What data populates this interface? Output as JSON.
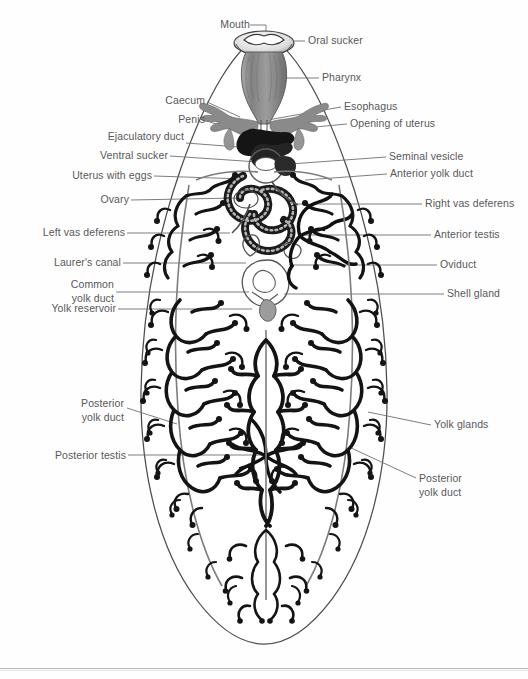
{
  "figure": {
    "organism_outline_color": "#4a4a4a",
    "leader_line_color": "#6d6d6f",
    "label_text_color": "#58585a",
    "yolk_gland_color": "#1a1a1a",
    "pharynx_fill": "#8e8e8e",
    "caecum_fill": "#8c8c8c",
    "background": "#ffffff"
  },
  "labels_left": [
    {
      "id": "mouth",
      "text": "Mouth",
      "x": 204,
      "y": 24,
      "w": 44,
      "lines": [
        "Mouth"
      ]
    },
    {
      "id": "caecum",
      "text": "Caecum",
      "x": 152,
      "y": 100,
      "w": 52,
      "lines": [
        "Caecum"
      ]
    },
    {
      "id": "penis",
      "text": "Penis",
      "x": 164,
      "y": 119,
      "w": 40,
      "lines": [
        "Penis"
      ]
    },
    {
      "id": "ejaculatory-duct",
      "text": "Ejaculatory duct",
      "x": 86,
      "y": 135,
      "w": 96,
      "lines": [
        "Ejaculatory",
        " duct"
      ]
    },
    {
      "id": "ventral-sucker",
      "text": "Ventral sucker",
      "x": 79,
      "y": 153,
      "w": 88,
      "lines": [
        "Ventral sucker"
      ]
    },
    {
      "id": "uterus-with-eggs",
      "text": "Uterus with eggs",
      "x": 53,
      "y": 173,
      "w": 98,
      "lines": [
        "Uterus with eggs"
      ]
    },
    {
      "id": "ovary",
      "text": "Ovary",
      "x": 88,
      "y": 197,
      "w": 40,
      "lines": [
        "Ovary"
      ]
    },
    {
      "id": "left-vas-deferens",
      "text": "Left vas deferens",
      "x": 24,
      "y": 230,
      "w": 100,
      "lines": [
        "Left vas deferens"
      ]
    },
    {
      "id": "laurers-canal",
      "text": "Laurer's canal",
      "x": 34,
      "y": 260,
      "w": 86,
      "lines": [
        "Laurer's canal"
      ]
    },
    {
      "id": "common-yolk-duct",
      "text": "Common yolk duct",
      "x": 27,
      "y": 281,
      "w": 86,
      "lines": [
        "Common",
        "yolk duct"
      ]
    },
    {
      "id": "yolk-reservoir",
      "text": "Yolk reservoir",
      "x": 31,
      "y": 306,
      "w": 84,
      "lines": [
        "Yolk reservoir"
      ]
    },
    {
      "id": "posterior-yolk-duct-left",
      "text": "Posterior yolk duct",
      "x": 57,
      "y": 401,
      "w": 66,
      "lines": [
        "Posterior",
        "yolk duct"
      ]
    },
    {
      "id": "posterior-testis",
      "text": "Posterior testis",
      "x": 35,
      "y": 453,
      "w": 90,
      "lines": [
        "Posterior testis"
      ]
    }
  ],
  "labels_right": [
    {
      "id": "oral-sucker",
      "text": "Oral sucker",
      "x": 308,
      "y": 39,
      "lines": [
        "Oral sucker"
      ]
    },
    {
      "id": "pharynx",
      "text": "Pharynx",
      "x": 322,
      "y": 76,
      "lines": [
        "Pharynx"
      ]
    },
    {
      "id": "esophagus",
      "text": "Esophagus",
      "x": 344,
      "y": 105,
      "lines": [
        "Esophagus"
      ]
    },
    {
      "id": "opening-of-uterus",
      "text": "Opening of uterus",
      "x": 350,
      "y": 122,
      "lines": [
        "Opening of uterus"
      ]
    },
    {
      "id": "seminal-vesicle",
      "text": "Seminal vesicle",
      "x": 389,
      "y": 155,
      "lines": [
        "Seminal vesicle"
      ]
    },
    {
      "id": "anterior-yolk-duct",
      "text": "Anterior yolk duct",
      "x": 390,
      "y": 172,
      "lines": [
        "Anterior yolk duct"
      ]
    },
    {
      "id": "right-vas-deferens",
      "text": "Right vas deferens",
      "x": 425,
      "y": 202,
      "lines": [
        "Right vas deferens"
      ]
    },
    {
      "id": "anterior-testis",
      "text": "Anterior testis",
      "x": 434,
      "y": 233,
      "lines": [
        "Anterior testis"
      ]
    },
    {
      "id": "oviduct",
      "text": "Oviduct",
      "x": 440,
      "y": 263,
      "lines": [
        "Oviduct"
      ]
    },
    {
      "id": "shell-gland",
      "text": "Shell gland",
      "x": 447,
      "y": 292,
      "lines": [
        "Shell gland"
      ]
    },
    {
      "id": "yolk-glands",
      "text": "Yolk glands",
      "x": 434,
      "y": 423,
      "lines": [
        "Yolk glands"
      ]
    },
    {
      "id": "posterior-yolk-duct-right",
      "text": "Posterior yolk duct",
      "x": 419,
      "y": 476,
      "lines": [
        "Posterior",
        "yolk duct"
      ]
    }
  ]
}
